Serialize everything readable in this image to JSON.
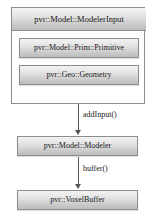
{
  "diagram": {
    "type": "uml-class-relationship",
    "composite": {
      "header_label": "pvr::Model::ModelerInput",
      "members": [
        {
          "label": "pvr::Model::Prim::Primitive"
        },
        {
          "label": "pvr::Geo::Geometry"
        }
      ]
    },
    "nodes": [
      {
        "label": "pvr::Model::Modeler"
      },
      {
        "label": "pvr::VoxelBuffer"
      }
    ],
    "edges": [
      {
        "label": "addInput()",
        "direction": "down"
      },
      {
        "label": "buffer()",
        "direction": "down"
      }
    ],
    "colors": {
      "box_border": "#8d8d8d",
      "box_gradient_top": "#f3f3f3",
      "box_gradient_bottom": "#bcbcbc",
      "container_background": "#ffffff",
      "arrow": "#555555",
      "text": "#1a1a1a"
    }
  }
}
